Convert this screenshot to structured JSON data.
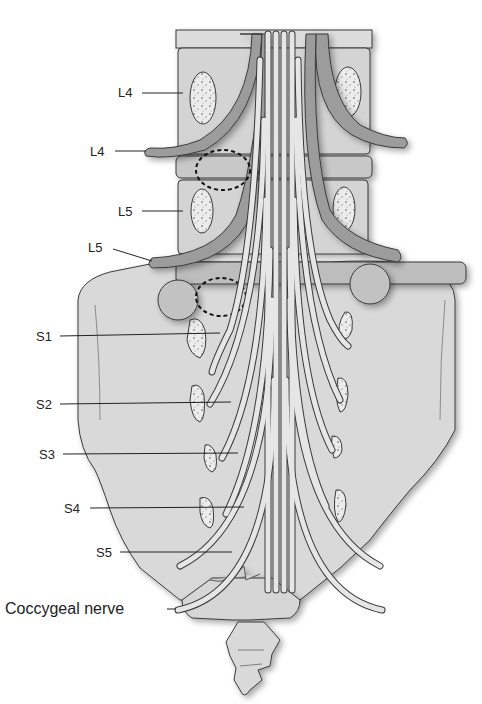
{
  "figure": {
    "colors": {
      "bone": "#dadada",
      "bone_dark": "#c9c9c9",
      "nerve_dark": "#9c9c9c",
      "nerve_light": "#e8e8e8",
      "disc": "#bdbdbd",
      "outline": "#3a3a3a",
      "label": "#222222"
    },
    "labels": [
      {
        "id": "L4-body",
        "text": "L4",
        "x": 118,
        "y": 86,
        "line_to": [
          183,
          93
        ]
      },
      {
        "id": "L4-root",
        "text": "L4",
        "x": 90,
        "y": 145,
        "line_to": [
          146,
          151
        ]
      },
      {
        "id": "L5-body",
        "text": "L5",
        "x": 118,
        "y": 205,
        "line_to": [
          183,
          211
        ]
      },
      {
        "id": "L5-root",
        "text": "L5",
        "x": 88,
        "y": 241,
        "line_to": [
          152,
          261
        ]
      },
      {
        "id": "S1",
        "text": "S1",
        "x": 36,
        "y": 330,
        "line_to": [
          220,
          333
        ]
      },
      {
        "id": "S2",
        "text": "S2",
        "x": 36,
        "y": 398,
        "line_to": [
          231,
          402
        ]
      },
      {
        "id": "S3",
        "text": "S3",
        "x": 39,
        "y": 448,
        "line_to": [
          238,
          453
        ]
      },
      {
        "id": "S4",
        "text": "S4",
        "x": 64,
        "y": 502,
        "line_to": [
          244,
          507
        ]
      },
      {
        "id": "S5",
        "text": "S5",
        "x": 96,
        "y": 546,
        "line_to": [
          232,
          552
        ]
      },
      {
        "id": "coccygeal",
        "text": "Coccygeal nerve",
        "x": 5,
        "y": 602,
        "line_to": [
          176,
          609
        ]
      }
    ]
  }
}
